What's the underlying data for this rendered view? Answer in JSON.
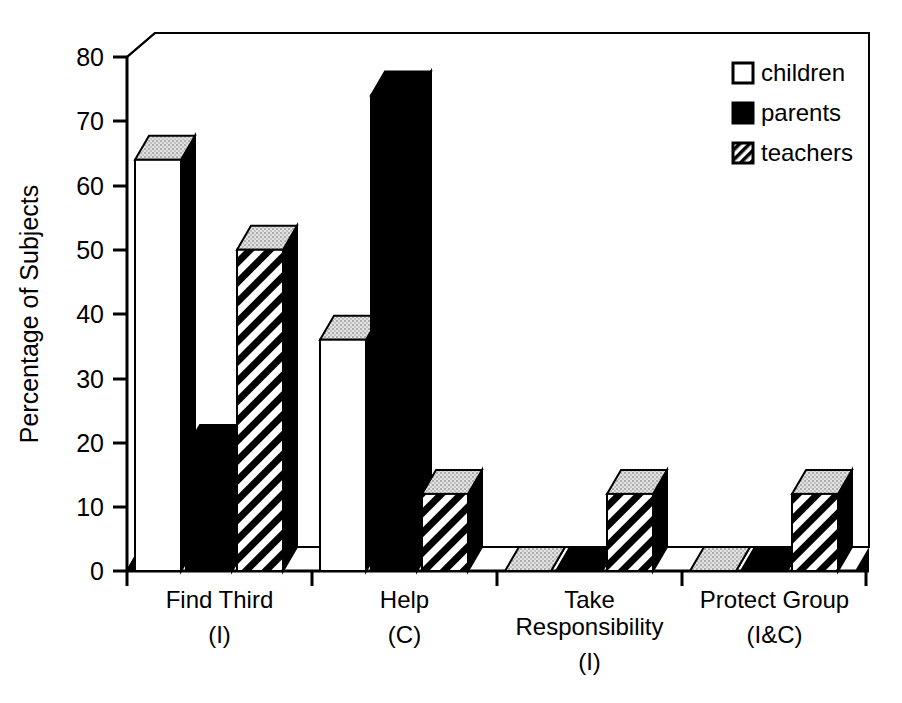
{
  "chart_data": {
    "type": "bar",
    "title": "",
    "xlabel": "",
    "ylabel": "Percentage of Subjects",
    "ylim": [
      0,
      80
    ],
    "yticks": [
      0,
      10,
      20,
      30,
      40,
      50,
      60,
      70,
      80
    ],
    "ytick_labels": [
      "0",
      "10",
      "20",
      "30",
      "40",
      "50",
      "60",
      "70",
      "80"
    ],
    "grid": false,
    "legend_position": "top-right",
    "three_d": true,
    "categories": [
      "Find Third",
      "Help",
      "Take Responsibility",
      "Protect Group"
    ],
    "category_sublabels": [
      "(I)",
      "(C)",
      "(I)",
      "(I&C)"
    ],
    "series": [
      {
        "name": "children",
        "pattern": "white",
        "values": [
          64,
          36,
          0,
          0
        ]
      },
      {
        "name": "parents",
        "pattern": "solid-black",
        "values": [
          19,
          74,
          0,
          0
        ]
      },
      {
        "name": "teachers",
        "pattern": "hatched",
        "values": [
          50,
          12,
          12,
          12
        ]
      }
    ]
  },
  "legend": {
    "items": [
      {
        "label": "children",
        "swatch": "white-square"
      },
      {
        "label": "parents",
        "swatch": "black-square"
      },
      {
        "label": "teachers",
        "swatch": "hatched-square"
      }
    ]
  },
  "colors": {
    "ink": "#000000",
    "paper": "#ffffff",
    "side_shade": "#111111",
    "top_shade": "#d9d9d9"
  }
}
